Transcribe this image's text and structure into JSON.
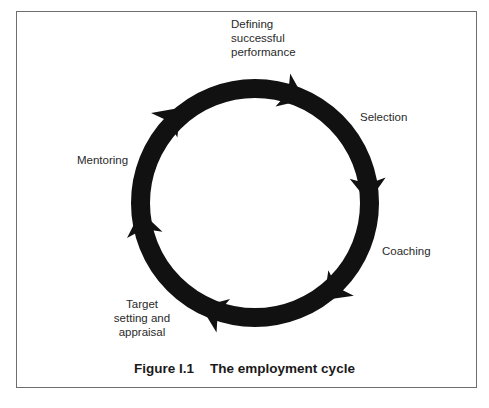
{
  "figure": {
    "caption_number": "Figure I.1",
    "caption_title": "The employment cycle"
  },
  "cycle": {
    "direction": "clockwise",
    "stages": [
      {
        "label_lines": [
          "Defining",
          "successful",
          "performance"
        ]
      },
      {
        "label_lines": [
          "Selection"
        ]
      },
      {
        "label_lines": [
          "Coaching"
        ]
      },
      {
        "label_lines": [
          "Target",
          "setting and",
          "appraisal"
        ]
      },
      {
        "label_lines": [
          "Mentoring"
        ]
      }
    ]
  },
  "colors": {
    "ring": "#111111",
    "border": "#6e6e6e",
    "text": "#2a2a2a",
    "background": "#ffffff"
  }
}
